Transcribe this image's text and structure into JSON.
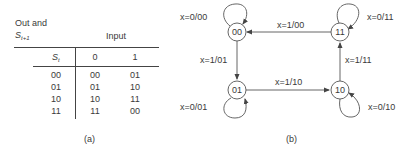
{
  "table": {
    "corner_label_line1": "Out and",
    "corner_label_s": "S",
    "corner_label_sub": "t+1",
    "input_header": "Input",
    "state_header_s": "S",
    "state_header_sub": "t",
    "input_columns": [
      "0",
      "1"
    ],
    "rows": [
      {
        "state": "00",
        "in0": "00",
        "in1": "01"
      },
      {
        "state": "01",
        "in0": "01",
        "in1": "10"
      },
      {
        "state": "10",
        "in0": "10",
        "in1": "11"
      },
      {
        "state": "11",
        "in0": "11",
        "in1": "00"
      }
    ],
    "caption": "(a)"
  },
  "diagram": {
    "states": [
      {
        "id": "00",
        "label": "00"
      },
      {
        "id": "01",
        "label": "01"
      },
      {
        "id": "10",
        "label": "10"
      },
      {
        "id": "11",
        "label": "11"
      }
    ],
    "transitions": [
      {
        "from": "00",
        "to": "00",
        "label": "x=0/00"
      },
      {
        "from": "00",
        "to": "01",
        "label": "x=1/01"
      },
      {
        "from": "01",
        "to": "01",
        "label": "x=0/01"
      },
      {
        "from": "01",
        "to": "10",
        "label": "x=1/10"
      },
      {
        "from": "10",
        "to": "10",
        "label": "x=0/10"
      },
      {
        "from": "10",
        "to": "11",
        "label": "x=1/11"
      },
      {
        "from": "11",
        "to": "11",
        "label": "x=0/11"
      },
      {
        "from": "11",
        "to": "00",
        "label": "x=1/00"
      }
    ],
    "caption": "(b)"
  }
}
